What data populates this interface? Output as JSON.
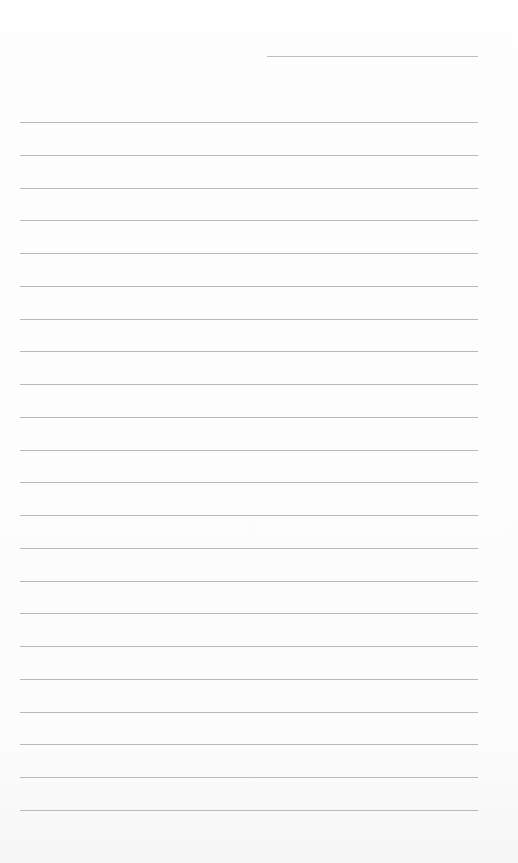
{
  "page": {
    "type": "lined-paper",
    "background_color": "#fdfdfd",
    "line_color": "#b9b9b9",
    "header_line": {
      "x": 267,
      "y": 56,
      "width": 211
    },
    "lines": {
      "x": 20,
      "width": 458,
      "first_y": 122,
      "spacing": 32.75,
      "count": 22
    }
  }
}
